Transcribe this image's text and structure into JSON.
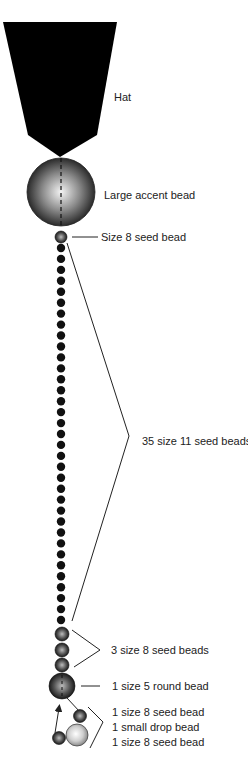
{
  "labels": {
    "hat": "Hat",
    "large_bead": "Large accent bead",
    "size8_top": "Size 8 seed bead",
    "size11": "35 size 11 seed beads",
    "size8_three": "3 size 8 seed beads",
    "size5": "1 size 5 round bead",
    "dangle_1": "1 size 8 seed bead",
    "dangle_2": "1 small drop bead",
    "dangle_3": "1 size 8 seed bead"
  },
  "counts": {
    "size11_beads": 35,
    "size8_group": 3
  },
  "colors": {
    "hat": "#000000",
    "line": "#222222",
    "bead_dark": "#111111"
  }
}
